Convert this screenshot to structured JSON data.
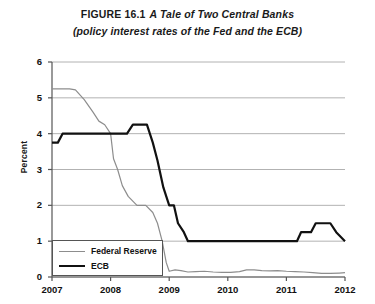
{
  "figure": {
    "label": "FIGURE 16.1",
    "name": "A Tale of Two Central Banks",
    "subtitle": "(policy interest rates of the Fed and the ECB)"
  },
  "legend": {
    "fed_label": "Federal Reserve",
    "ecb_label": "ECB"
  },
  "colors": {
    "fed": "#8d8d8d",
    "ecb": "#111111",
    "grid": "#a9a9a9",
    "axis": "#555555",
    "background": "#ffffff"
  },
  "chart_data": {
    "type": "line",
    "subtitle": "(policy interest rates of the Fed and the ECB)",
    "xlabel": "",
    "ylabel": "Percent",
    "xlim": [
      2007,
      2012
    ],
    "ylim": [
      0,
      6
    ],
    "yticks": [
      0,
      1,
      2,
      3,
      4,
      5,
      6
    ],
    "ytick_labels": [
      "0",
      "1",
      "2",
      "3",
      "4",
      "5",
      "6"
    ],
    "xticks": [
      2007,
      2008,
      2009,
      2010,
      2011,
      2012
    ],
    "xtick_labels": [
      "2007",
      "2008",
      "2009",
      "2010",
      "2011",
      "2012"
    ],
    "grid": true,
    "grid_axis": "y",
    "legend_position": "lower left",
    "series": [
      {
        "name": "Federal Reserve",
        "color": "#8d8d8d",
        "linewidth": 1.2,
        "points": [
          [
            2007.0,
            5.25
          ],
          [
            2007.3,
            5.25
          ],
          [
            2007.4,
            5.22
          ],
          [
            2007.55,
            4.95
          ],
          [
            2007.7,
            4.6
          ],
          [
            2007.8,
            4.35
          ],
          [
            2007.9,
            4.25
          ],
          [
            2008.0,
            4.0
          ],
          [
            2008.05,
            3.3
          ],
          [
            2008.12,
            3.0
          ],
          [
            2008.2,
            2.55
          ],
          [
            2008.3,
            2.25
          ],
          [
            2008.45,
            2.0
          ],
          [
            2008.6,
            2.0
          ],
          [
            2008.72,
            1.8
          ],
          [
            2008.8,
            1.5
          ],
          [
            2008.88,
            1.0
          ],
          [
            2008.95,
            0.4
          ],
          [
            2009.0,
            0.16
          ],
          [
            2009.1,
            0.2
          ],
          [
            2009.2,
            0.18
          ],
          [
            2009.32,
            0.14
          ],
          [
            2009.45,
            0.15
          ],
          [
            2009.6,
            0.16
          ],
          [
            2009.75,
            0.14
          ],
          [
            2009.9,
            0.13
          ],
          [
            2010.05,
            0.13
          ],
          [
            2010.2,
            0.15
          ],
          [
            2010.32,
            0.2
          ],
          [
            2010.45,
            0.2
          ],
          [
            2010.58,
            0.18
          ],
          [
            2010.72,
            0.17
          ],
          [
            2010.85,
            0.18
          ],
          [
            2011.0,
            0.16
          ],
          [
            2011.15,
            0.15
          ],
          [
            2011.3,
            0.14
          ],
          [
            2011.45,
            0.12
          ],
          [
            2011.6,
            0.1
          ],
          [
            2011.75,
            0.1
          ],
          [
            2011.9,
            0.11
          ],
          [
            2012.0,
            0.12
          ]
        ]
      },
      {
        "name": "ECB",
        "color": "#111111",
        "linewidth": 2.2,
        "points": [
          [
            2007.0,
            3.75
          ],
          [
            2007.1,
            3.75
          ],
          [
            2007.18,
            4.0
          ],
          [
            2008.28,
            4.0
          ],
          [
            2008.38,
            4.25
          ],
          [
            2008.62,
            4.25
          ],
          [
            2008.72,
            3.75
          ],
          [
            2008.8,
            3.25
          ],
          [
            2008.9,
            2.5
          ],
          [
            2009.0,
            2.0
          ],
          [
            2009.08,
            2.0
          ],
          [
            2009.15,
            1.5
          ],
          [
            2009.25,
            1.25
          ],
          [
            2009.32,
            1.0
          ],
          [
            2011.18,
            1.0
          ],
          [
            2011.25,
            1.25
          ],
          [
            2011.42,
            1.25
          ],
          [
            2011.5,
            1.5
          ],
          [
            2011.75,
            1.5
          ],
          [
            2011.85,
            1.25
          ],
          [
            2012.0,
            1.0
          ]
        ]
      }
    ]
  }
}
